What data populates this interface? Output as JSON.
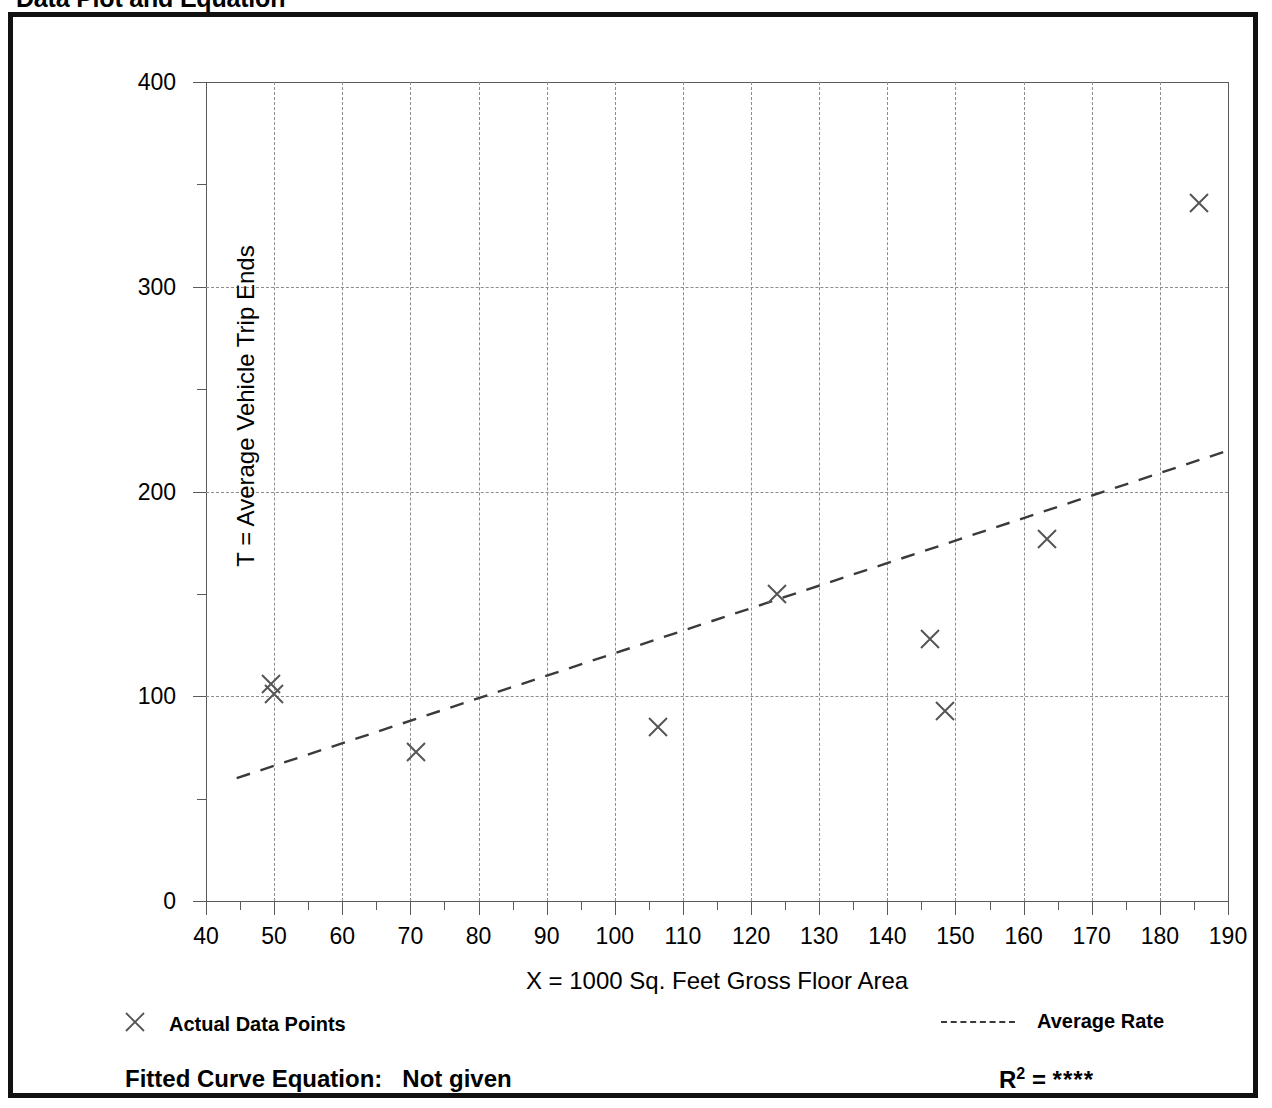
{
  "page_title": "Data Plot and Equation",
  "axes": {
    "y_title": "T = Average Vehicle Trip Ends",
    "x_title": "X = 1000 Sq. Feet Gross Floor Area"
  },
  "legend": {
    "data_points_label": "Actual Data Points",
    "data_points_marker": "x-cross-marker",
    "average_rate_label": "Average Rate",
    "average_rate_marker": "dashed-line-swatch"
  },
  "footer": {
    "fitted_curve_label": "Fitted Curve Equation:",
    "fitted_curve_value": "Not given",
    "r_squared_label": "R",
    "r_squared_exponent": "2",
    "r_squared_equals": "=",
    "r_squared_value": "****"
  },
  "colors": {
    "frame": "#111111",
    "axis": "#5a5a5a",
    "gridline": "#8d8d8d",
    "marker": "#555555",
    "trend_line": "#3a3a3a",
    "background": "#ffffff"
  },
  "chart_data": {
    "type": "scatter",
    "title": "Data Plot and Equation",
    "xlabel": "X = 1000 Sq. Feet Gross Floor Area",
    "ylabel": "T = Average Vehicle Trip Ends",
    "xlim": [
      40,
      190
    ],
    "ylim": [
      0,
      400
    ],
    "grid": true,
    "legend_position": "below-plot",
    "x_ticks": [
      40,
      50,
      60,
      70,
      80,
      90,
      100,
      110,
      120,
      130,
      140,
      150,
      160,
      170,
      180,
      190
    ],
    "x_minor_tick_step": 5,
    "y_ticks": [
      0,
      100,
      200,
      300,
      400
    ],
    "y_minor_tick_step": 50,
    "gridline_y_values": [
      100,
      200,
      300
    ],
    "gridline_x_values": [
      50,
      60,
      70,
      80,
      90,
      100,
      110,
      120,
      130,
      140,
      150,
      160,
      170,
      180
    ],
    "series": [
      {
        "name": "Actual Data Points",
        "type": "scatter",
        "marker": "x",
        "points": [
          {
            "x": 49.5,
            "y": 106
          },
          {
            "x": 50.0,
            "y": 101
          },
          {
            "x": 70.8,
            "y": 73
          },
          {
            "x": 106.4,
            "y": 85
          },
          {
            "x": 123.8,
            "y": 150
          },
          {
            "x": 146.3,
            "y": 128
          },
          {
            "x": 148.5,
            "y": 93
          },
          {
            "x": 163.4,
            "y": 177
          },
          {
            "x": 185.8,
            "y": 341
          }
        ]
      },
      {
        "name": "Average Rate",
        "type": "line",
        "style": "dashed",
        "endpoints": [
          {
            "x": 44.5,
            "y": 60
          },
          {
            "x": 190.0,
            "y": 220
          }
        ]
      }
    ]
  }
}
